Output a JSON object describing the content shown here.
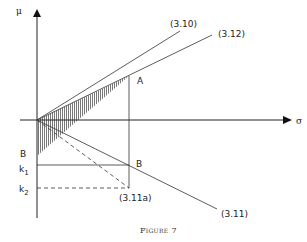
{
  "figure": {
    "caption": "Figure 7",
    "caption_prefix": "F",
    "caption_rest": "IGURE",
    "caption_number": "7"
  },
  "axes": {
    "y_label": "μ",
    "x_label": "σ"
  },
  "points": {
    "A": "A",
    "B_right": "B",
    "B_left": "B"
  },
  "levels": {
    "k1": "k",
    "k1_sub": "1",
    "k2": "k",
    "k2_sub": "2"
  },
  "line_labels": {
    "eq_3_10": "(3.10)",
    "eq_3_12": "(3.12)",
    "eq_3_11": "(3.11)",
    "eq_3_11a": "(3.11a)"
  },
  "colors": {
    "ink": "#222222",
    "hatch": "#555555",
    "background": "#ffffff"
  }
}
